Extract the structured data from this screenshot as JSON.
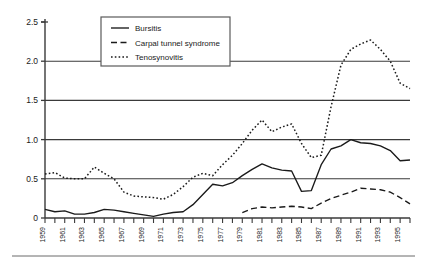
{
  "chart_data": {
    "type": "line",
    "title": "",
    "xlabel": "",
    "ylabel": "",
    "xlim": [
      1959,
      1996
    ],
    "ylim": [
      0,
      2.5
    ],
    "grid": "horizontal",
    "legend_position": "top-left-inside",
    "y_ticks": [
      "0",
      "0.5",
      "1.0",
      "1.5",
      "2.0",
      "2.5"
    ],
    "y_tick_values": [
      0,
      0.5,
      1.0,
      1.5,
      2.0,
      2.5
    ],
    "x_tick_labels": [
      "1959",
      "1961",
      "1963",
      "1965",
      "1967",
      "1969",
      "1971",
      "1973",
      "1975",
      "1977",
      "1979",
      "1981",
      "1983",
      "1985",
      "1987",
      "1989",
      "1991",
      "1993",
      "1995"
    ],
    "x_tick_label_values": [
      1959,
      1961,
      1963,
      1965,
      1967,
      1969,
      1971,
      1973,
      1975,
      1977,
      1979,
      1981,
      1983,
      1985,
      1987,
      1989,
      1991,
      1993,
      1995
    ],
    "x_minor_ticks": [
      1959,
      1960,
      1961,
      1962,
      1963,
      1964,
      1965,
      1966,
      1967,
      1968,
      1969,
      1970,
      1971,
      1972,
      1973,
      1974,
      1975,
      1976,
      1977,
      1978,
      1979,
      1980,
      1981,
      1982,
      1983,
      1984,
      1985,
      1986,
      1987,
      1988,
      1989,
      1990,
      1991,
      1992,
      1993,
      1994,
      1995,
      1996
    ],
    "series": [
      {
        "name": "Bursitis",
        "style": "solid",
        "color": "#1a1a1a",
        "x": [
          1959,
          1960,
          1961,
          1962,
          1963,
          1964,
          1965,
          1966,
          1967,
          1968,
          1969,
          1970,
          1971,
          1972,
          1973,
          1974,
          1975,
          1976,
          1977,
          1978,
          1979,
          1980,
          1981,
          1982,
          1983,
          1984,
          1985,
          1986,
          1987,
          1988,
          1989,
          1990,
          1991,
          1992,
          1993,
          1994,
          1995,
          1996
        ],
        "values": [
          0.11,
          0.08,
          0.09,
          0.05,
          0.05,
          0.07,
          0.11,
          0.1,
          0.08,
          0.06,
          0.04,
          0.02,
          0.05,
          0.07,
          0.08,
          0.17,
          0.3,
          0.43,
          0.41,
          0.45,
          0.54,
          0.62,
          0.69,
          0.64,
          0.61,
          0.6,
          0.34,
          0.35,
          0.68,
          0.88,
          0.92,
          1.0,
          0.96,
          0.95,
          0.92,
          0.86,
          0.73,
          0.74
        ]
      },
      {
        "name": "Carpal tunnel syndrome",
        "style": "dashed",
        "color": "#1a1a1a",
        "x": [
          1979,
          1980,
          1981,
          1982,
          1983,
          1984,
          1985,
          1986,
          1987,
          1988,
          1989,
          1990,
          1991,
          1992,
          1993,
          1994,
          1995,
          1996
        ],
        "values": [
          0.07,
          0.12,
          0.14,
          0.13,
          0.14,
          0.15,
          0.14,
          0.12,
          0.19,
          0.25,
          0.29,
          0.33,
          0.38,
          0.37,
          0.36,
          0.33,
          0.26,
          0.18
        ]
      },
      {
        "name": "Tenosynovitis",
        "style": "dotted",
        "color": "#1a1a1a",
        "x": [
          1959,
          1960,
          1961,
          1962,
          1963,
          1964,
          1965,
          1966,
          1967,
          1968,
          1969,
          1970,
          1971,
          1972,
          1973,
          1974,
          1975,
          1976,
          1977,
          1978,
          1979,
          1980,
          1981,
          1982,
          1983,
          1984,
          1985,
          1986,
          1987,
          1988,
          1989,
          1990,
          1991,
          1992,
          1993,
          1994,
          1995,
          1996
        ],
        "values": [
          0.56,
          0.58,
          0.51,
          0.5,
          0.5,
          0.65,
          0.57,
          0.5,
          0.33,
          0.28,
          0.27,
          0.26,
          0.24,
          0.3,
          0.4,
          0.52,
          0.57,
          0.54,
          0.68,
          0.8,
          0.95,
          1.12,
          1.25,
          1.1,
          1.16,
          1.2,
          0.95,
          0.77,
          0.8,
          1.42,
          1.95,
          2.15,
          2.22,
          2.27,
          2.15,
          2.0,
          1.72,
          1.65
        ]
      }
    ]
  },
  "legend": {
    "items": [
      {
        "label": "Bursitis",
        "style": "solid"
      },
      {
        "label": "Carpal tunnel syndrome",
        "style": "dashed"
      },
      {
        "label": "Tenosynovitis",
        "style": "dotted"
      }
    ]
  }
}
